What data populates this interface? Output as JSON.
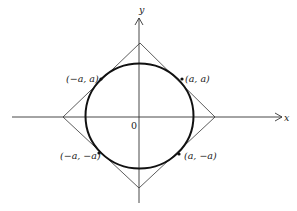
{
  "figure": {
    "axes": {
      "x_label": "x",
      "y_label": "y",
      "origin_label": "0"
    },
    "curve": {
      "type": "circle-like closed curve",
      "stroke": "#111111"
    },
    "tangent_square": {
      "type": "diamond (rotated square)",
      "stroke": "#333333"
    },
    "points": [
      {
        "label": "(−a, a)",
        "position": "upper-left"
      },
      {
        "label": "(a, a)",
        "position": "upper-right"
      },
      {
        "label": "(−a, −a)",
        "position": "lower-left"
      },
      {
        "label": "(a, −a)",
        "position": "lower-right"
      }
    ]
  }
}
